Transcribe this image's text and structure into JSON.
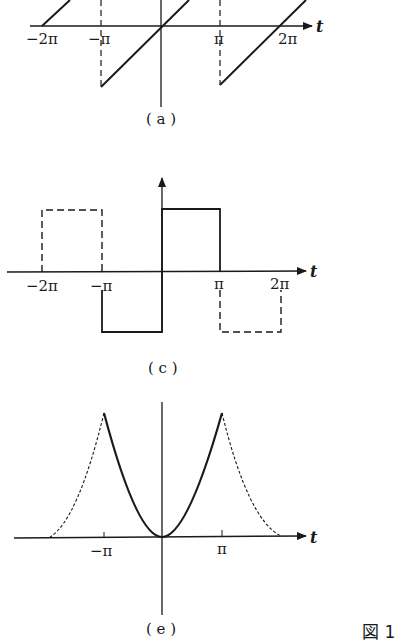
{
  "colors": {
    "ink": "#1a1a1a",
    "background": "#ffffff"
  },
  "figure_label": "図 1",
  "panels": [
    {
      "id": "a",
      "caption": "( a )",
      "type": "sawtooth",
      "axis_var": "t",
      "ticks": [
        "−2π",
        "−π",
        "π",
        "2π"
      ]
    },
    {
      "id": "c",
      "caption": "( c )",
      "type": "square-wave",
      "axis_var": "t",
      "ticks": [
        "−2π",
        "−π",
        "π",
        "2π"
      ]
    },
    {
      "id": "e",
      "caption": "( e )",
      "type": "parabolic-periodic",
      "axis_var": "t",
      "ticks": [
        "−π",
        "π"
      ]
    }
  ]
}
